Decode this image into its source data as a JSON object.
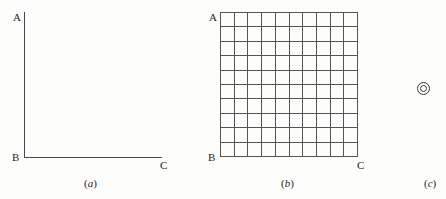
{
  "figure": {
    "background_color": "#fdfdfc",
    "line_color": "#4a4a4a",
    "grid_line_color": "#555555",
    "text_color": "#1d1d1d"
  },
  "panels": [
    {
      "id": "a",
      "caption": "(a)",
      "caption_letter": "a",
      "type": "empty-axes",
      "vertices": {
        "top_left": "A",
        "bottom_left": "B",
        "bottom_right": "C"
      },
      "grid": {
        "columns": 0,
        "rows": 0
      }
    },
    {
      "id": "b",
      "caption": "(b)",
      "caption_letter": "b",
      "type": "grid",
      "vertices": {
        "top_left": "A",
        "bottom_left": "B",
        "bottom_right": "C"
      },
      "grid": {
        "columns": 10,
        "rows": 10
      }
    },
    {
      "id": "c",
      "caption": "(c)",
      "caption_letter": "c",
      "type": "symbol",
      "symbol_name": "double-circle-symbol",
      "symbol_glyph": "◎"
    }
  ]
}
